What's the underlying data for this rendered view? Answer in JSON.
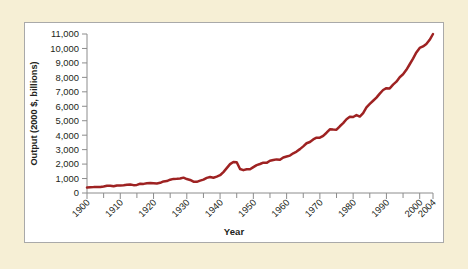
{
  "figure": {
    "background_color": "#f6efd5",
    "panel_color": "#ffffff",
    "border_color": "#a9a9a9"
  },
  "chart_data": {
    "type": "line",
    "title": "",
    "xlabel": "Year",
    "ylabel": "Output (2000 $, billions)",
    "xlim": [
      1900,
      2004
    ],
    "ylim": [
      0,
      11000
    ],
    "grid": false,
    "legend": null,
    "line_color": "#9e2222",
    "x_ticks": [
      1900,
      1910,
      1920,
      1930,
      1940,
      1950,
      1960,
      1970,
      1980,
      1990,
      2000,
      2004
    ],
    "x_tick_labels": [
      "1900",
      "1910",
      "1920",
      "1930",
      "1940",
      "1950",
      "1960",
      "1970",
      "1980",
      "1990",
      "2000",
      "2004"
    ],
    "x_minor_ticks": [
      1905,
      1915,
      1925,
      1935,
      1945,
      1955,
      1965,
      1975,
      1985,
      1995
    ],
    "y_ticks": [
      0,
      1000,
      2000,
      3000,
      4000,
      5000,
      6000,
      7000,
      8000,
      9000,
      10000,
      11000
    ],
    "y_tick_labels": [
      "0",
      "1,000",
      "2,000",
      "3,000",
      "4,000",
      "5,000",
      "6,000",
      "7,000",
      "8,000",
      "9,000",
      "10,000",
      "11,000"
    ],
    "series": [
      {
        "name": "Real GDP",
        "x": [
          1900,
          1901,
          1902,
          1903,
          1904,
          1905,
          1906,
          1907,
          1908,
          1909,
          1910,
          1911,
          1912,
          1913,
          1914,
          1915,
          1916,
          1917,
          1918,
          1919,
          1920,
          1921,
          1922,
          1923,
          1924,
          1925,
          1926,
          1927,
          1928,
          1929,
          1930,
          1931,
          1932,
          1933,
          1934,
          1935,
          1936,
          1937,
          1938,
          1939,
          1940,
          1941,
          1942,
          1943,
          1944,
          1945,
          1946,
          1947,
          1948,
          1949,
          1950,
          1951,
          1952,
          1953,
          1954,
          1955,
          1956,
          1957,
          1958,
          1959,
          1960,
          1961,
          1962,
          1963,
          1964,
          1965,
          1966,
          1967,
          1968,
          1969,
          1970,
          1971,
          1972,
          1973,
          1974,
          1975,
          1976,
          1977,
          1978,
          1979,
          1980,
          1981,
          1982,
          1983,
          1984,
          1985,
          1986,
          1987,
          1988,
          1989,
          1990,
          1991,
          1992,
          1993,
          1994,
          1995,
          1996,
          1997,
          1998,
          1999,
          2000,
          2001,
          2002,
          2003,
          2004
        ],
        "values": [
          470,
          500,
          510,
          530,
          520,
          560,
          620,
          630,
          580,
          650,
          660,
          680,
          720,
          740,
          680,
          700,
          800,
          790,
          850,
          860,
          850,
          830,
          880,
          1000,
          1030,
          1150,
          1220,
          1230,
          1250,
          1330,
          1210,
          1130,
          980,
          965,
          1070,
          1160,
          1310,
          1380,
          1320,
          1420,
          1540,
          1810,
          2150,
          2500,
          2690,
          2660,
          2080,
          1980,
          2060,
          2050,
          2240,
          2410,
          2510,
          2630,
          2610,
          2790,
          2850,
          2910,
          2880,
          3080,
          3160,
          3240,
          3440,
          3590,
          3800,
          4040,
          4310,
          4420,
          4640,
          4790,
          4790,
          4950,
          5220,
          5520,
          5490,
          5480,
          5780,
          6050,
          6390,
          6600,
          6580,
          6750,
          6620,
          6920,
          7420,
          7720,
          7990,
          8260,
          8610,
          8920,
          9080,
          9060,
          9380,
          9640,
          10030,
          10280,
          10670,
          11150,
          11640,
          12170,
          12560,
          12690,
          12910,
          13270,
          13770
        ]
      }
    ],
    "series_display_values": [
      470,
      500,
      510,
      530,
      520,
      560,
      620,
      630,
      580,
      650,
      660,
      680,
      720,
      740,
      680,
      700,
      800,
      790,
      850,
      860,
      850,
      830,
      880,
      1000,
      1030,
      1150,
      1220,
      1230,
      1250,
      1330,
      1210,
      1130,
      980,
      965,
      1070,
      1160,
      1310,
      1380,
      1320,
      1420,
      1540,
      1810,
      2150,
      2500,
      2690,
      2660,
      2080,
      1980,
      2060,
      2050,
      2240,
      2410,
      2510,
      2630,
      2610,
      2790,
      2850,
      2910,
      2880,
      3080,
      3160,
      3240,
      3440,
      3590,
      3800,
      4040,
      4310,
      4420,
      4640,
      4790,
      4790,
      4950,
      5220,
      5520,
      5490,
      5480,
      5780,
      6050,
      6390,
      6600,
      6580,
      6750,
      6620,
      6920,
      7420,
      7720,
      7990,
      8260,
      8610,
      8920,
      9080,
      9060,
      9380,
      9640,
      10030,
      10280,
      10670,
      11150,
      11640,
      12170,
      12560,
      12690,
      12910,
      13270,
      13770
    ]
  }
}
